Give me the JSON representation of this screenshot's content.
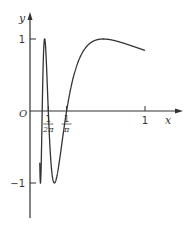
{
  "chart_data": {
    "type": "line",
    "title": "",
    "function": "y = sin(1/x)",
    "xlabel": "x",
    "ylabel": "y",
    "origin_label": "O",
    "x_ticks": [
      {
        "value": 0.159,
        "label": "1/2π",
        "num": "1",
        "den": "2π"
      },
      {
        "value": 0.318,
        "label": "1/π",
        "num": "1",
        "den": "π"
      },
      {
        "value": 1,
        "label": "1"
      }
    ],
    "y_ticks": [
      {
        "value": 1,
        "label": "1"
      },
      {
        "value": -1,
        "label": "-1"
      }
    ],
    "xlim": [
      0,
      1.15
    ],
    "ylim": [
      -1.4,
      1.2
    ],
    "grid": false,
    "legend": null,
    "domain_shown": [
      0.085,
      1.0
    ],
    "series": [
      {
        "name": "sin(1/x)",
        "color": "#333333"
      }
    ]
  },
  "colors": {
    "axis": "#333333",
    "curve": "#333333",
    "background": "#ffffff"
  }
}
